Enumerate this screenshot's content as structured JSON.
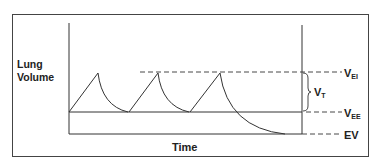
{
  "diagram": {
    "y_axis_label_line1": "Lung",
    "y_axis_label_line2": "Volume",
    "x_axis_label": "Time",
    "labels": {
      "vei_main": "V",
      "vei_sub": "EI",
      "vt_main": "V",
      "vt_sub": "T",
      "vee_main": "V",
      "vee_sub": "EE",
      "ev": "EV"
    },
    "colors": {
      "line": "#333333",
      "border": "#444444"
    }
  }
}
